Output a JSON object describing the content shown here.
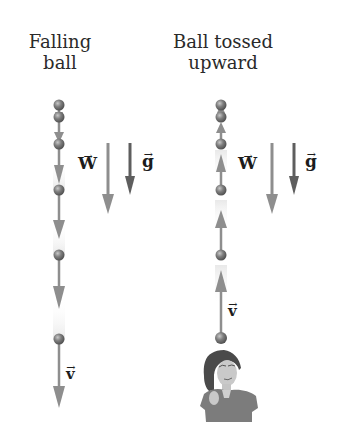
{
  "panels": [
    {
      "id": "falling",
      "title_line1": "Falling",
      "title_line2": "ball",
      "velocity_label": "v",
      "weight_label": "W",
      "gravity_label": "g",
      "velocity_direction": "down"
    },
    {
      "id": "tossed",
      "title_line1": "Ball tossed",
      "title_line2": "upward",
      "velocity_label": "v",
      "weight_label": "W",
      "gravity_label": "g",
      "velocity_direction": "up"
    }
  ],
  "vector_arrow_glyph": "→",
  "colors": {
    "arrow_light": "#8e8e8e",
    "arrow_dark": "#5e5e5e",
    "ball": "#7a7a7a",
    "text": "#2a2a2a"
  }
}
